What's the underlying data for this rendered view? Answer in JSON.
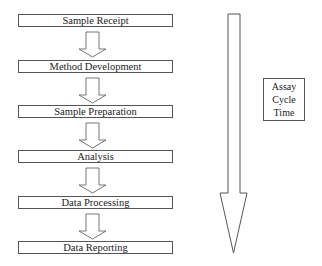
{
  "diagram": {
    "steps": [
      {
        "label": "Sample Receipt"
      },
      {
        "label": "Method Development"
      },
      {
        "label": "Sample Preparation"
      },
      {
        "label": "Analysis"
      },
      {
        "label": "Data Processing"
      },
      {
        "label": "Data Reporting"
      }
    ],
    "side_label": {
      "lines": [
        "Assay",
        "Cycle",
        "Time"
      ]
    },
    "colors": {
      "stroke": "#555555",
      "fill": "#ffffff",
      "text": "#222222"
    }
  }
}
